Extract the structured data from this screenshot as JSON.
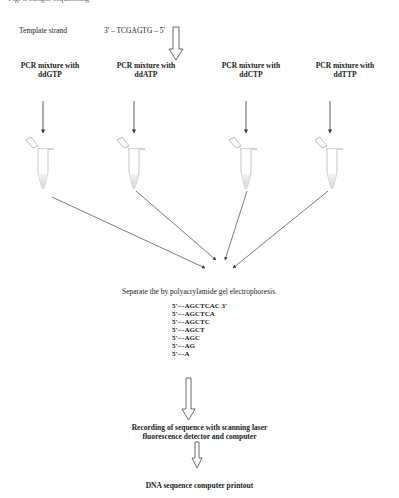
{
  "top_fragment": "Fig. 3 Sanger sequencing",
  "template": {
    "label": "Template strand",
    "sequence": "3' – TCGAGTG – 5'"
  },
  "mixtures": [
    {
      "line1": "PCR mixture with",
      "line2": "ddGTP"
    },
    {
      "line1": "PCR mixture with",
      "line2": "ddATP"
    },
    {
      "line1": "PCR mixture with",
      "line2": "ddCTP"
    },
    {
      "line1": "PCR mixture with",
      "line2": "ddTTP"
    }
  ],
  "separation_step": "Separate the by polyacrylamide gel electrophoresis.",
  "fragments": [
    "5'---AGCTCAC 3'",
    "5'---AGCTCA",
    "5'---AGCTC",
    "5'---AGCT",
    "5'---AGC",
    "5'---AG",
    "5'---A"
  ],
  "recording_step": {
    "line1": "Recording of sequence with scanning laser",
    "line2": "fluorescence detector and computer"
  },
  "final_step": "DNA sequence computer printout"
}
